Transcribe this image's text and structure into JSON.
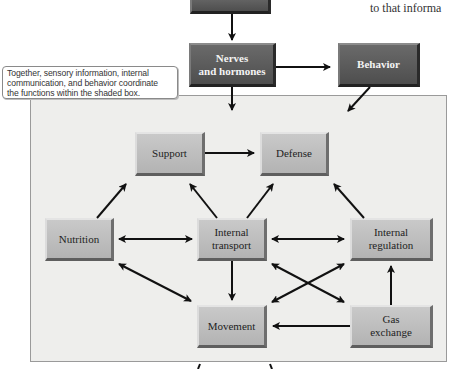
{
  "header": {
    "top_box_label": "",
    "right_text": "to that informa"
  },
  "upper": {
    "nerves_box": {
      "line1": "Nerves",
      "line2": "and hormones"
    },
    "behavior_box": {
      "label": "Behavior"
    },
    "callout": {
      "line1": "Together, sensory information, internal",
      "line2": "communication, and behavior coordinate",
      "line3": "the functions within the shaded box."
    }
  },
  "shaded_box": {
    "nodes": {
      "support": {
        "label": "Support"
      },
      "defense": {
        "label": "Defense"
      },
      "nutrition": {
        "label": "Nutrition"
      },
      "internal_transport": {
        "line1": "Internal",
        "line2": "transport"
      },
      "internal_regulation": {
        "line1": "Internal",
        "line2": "regulation"
      },
      "movement": {
        "label": "Movement"
      },
      "gas_exchange": {
        "line1": "Gas",
        "line2": "exchange"
      }
    },
    "edges": [
      {
        "from": "Support",
        "to": "Defense",
        "type": "one-way"
      },
      {
        "from": "Nutrition",
        "to": "Support",
        "type": "one-way"
      },
      {
        "from": "Internal transport",
        "to": "Support",
        "type": "one-way"
      },
      {
        "from": "Internal transport",
        "to": "Defense",
        "type": "one-way"
      },
      {
        "from": "Internal regulation",
        "to": "Defense",
        "type": "one-way"
      },
      {
        "from": "Nutrition",
        "to": "Internal transport",
        "type": "two-way"
      },
      {
        "from": "Internal transport",
        "to": "Internal regulation",
        "type": "two-way"
      },
      {
        "from": "Nutrition",
        "to": "Movement",
        "type": "two-way"
      },
      {
        "from": "Internal transport",
        "to": "Movement",
        "type": "one-way"
      },
      {
        "from": "Internal transport",
        "to": "Gas exchange",
        "type": "two-way"
      },
      {
        "from": "Movement",
        "to": "Internal regulation",
        "type": "two-way"
      },
      {
        "from": "Gas exchange",
        "to": "Internal regulation",
        "type": "one-way"
      },
      {
        "from": "Gas exchange",
        "to": "Movement",
        "type": "one-way"
      }
    ]
  },
  "colors": {
    "dark_box": "#575757",
    "light_box": "#bdbdbd",
    "shaded_bg": "#eeeeec",
    "arrow": "#111111"
  }
}
